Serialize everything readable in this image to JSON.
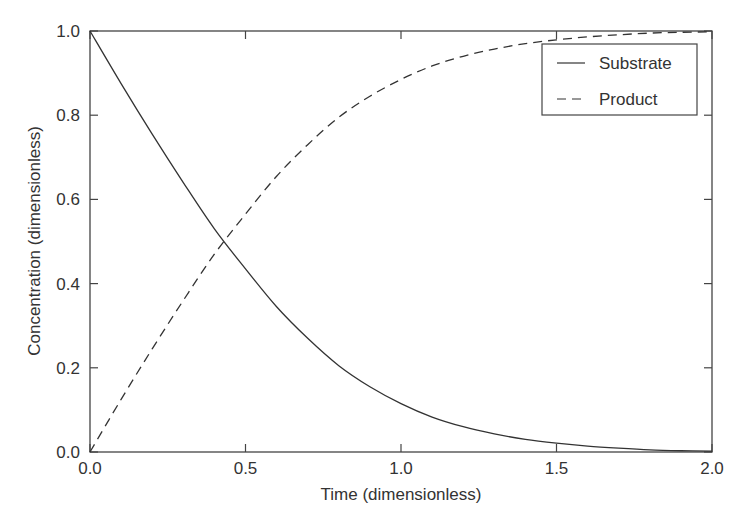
{
  "chart_data": {
    "type": "line",
    "title": "",
    "xlabel": "Time (dimensionless)",
    "ylabel": "Concentration (dimensionless)",
    "xlim": [
      0.0,
      2.0
    ],
    "ylim": [
      0.0,
      1.0
    ],
    "xticks": [
      "0.0",
      "0.5",
      "1.0",
      "1.5",
      "2.0"
    ],
    "yticks": [
      "0.0",
      "0.2",
      "0.4",
      "0.6",
      "0.8",
      "1.0"
    ],
    "grid": false,
    "legend_position": "upper right",
    "x": [
      0.0,
      0.1,
      0.2,
      0.3,
      0.4,
      0.5,
      0.6,
      0.7,
      0.8,
      0.9,
      1.0,
      1.1,
      1.2,
      1.3,
      1.4,
      1.5,
      1.6,
      1.7,
      1.8,
      1.9,
      2.0
    ],
    "series": [
      {
        "name": "Substrate",
        "style": "solid",
        "values": [
          1.0,
          0.875,
          0.755,
          0.64,
          0.53,
          0.435,
          0.345,
          0.27,
          0.205,
          0.155,
          0.115,
          0.083,
          0.06,
          0.043,
          0.03,
          0.021,
          0.014,
          0.009,
          0.005,
          0.003,
          0.002
        ]
      },
      {
        "name": "Product",
        "style": "dashed",
        "values": [
          0.0,
          0.125,
          0.245,
          0.36,
          0.47,
          0.565,
          0.655,
          0.73,
          0.795,
          0.845,
          0.885,
          0.917,
          0.94,
          0.957,
          0.97,
          0.979,
          0.986,
          0.991,
          0.995,
          0.997,
          0.998
        ]
      }
    ]
  },
  "colors": {
    "line": "#333333",
    "axes": "#444444",
    "background": "#ffffff"
  }
}
